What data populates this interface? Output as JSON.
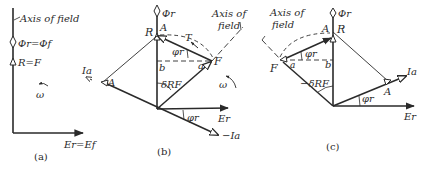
{
  "colors": {
    "ink": "#2a2a2a",
    "background": "#ffffff"
  },
  "panel_a": {
    "caption": "(a)",
    "axis_label": "Axis of field",
    "flux_label": "Φr=Φf",
    "mmf_label": "R=F",
    "omega": "ω",
    "emf_label": "Er=Ef"
  },
  "panel_b": {
    "caption": "(b)",
    "flux_label": "Φr",
    "R": "R",
    "A_top": "A",
    "phi_angle": "φr",
    "b": "b",
    "a": "a",
    "F": "F",
    "T": "T",
    "axis_label_1": "Axis of",
    "axis_label_2": "field",
    "A_left": "A",
    "I_label": "Ia",
    "delta": "δRF",
    "omega": "ω",
    "emf_label": "Er",
    "phi_angle_bottom": "φr",
    "neg_I_label": "−Ia"
  },
  "panel_c": {
    "caption": "(c)",
    "axis_label_1": "Axis of",
    "axis_label_2": "field",
    "flux_label": "Φr",
    "A_top": "A",
    "R": "R",
    "phi_angle": "φr",
    "F": "F",
    "a": "a",
    "b": "b",
    "delta": "−δRF",
    "I_label": "Ia",
    "A_right": "A",
    "phi_angle_bottom": "φr",
    "emf_label": "Er"
  }
}
